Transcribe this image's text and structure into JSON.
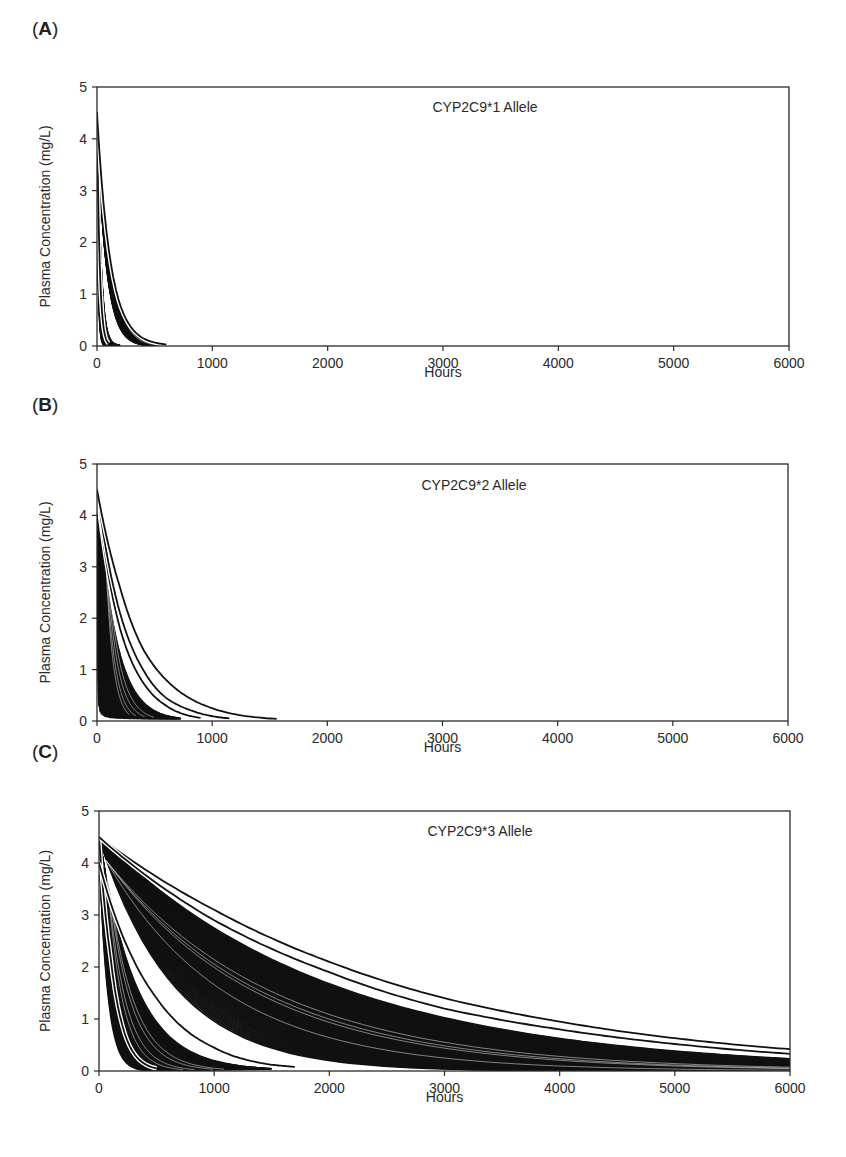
{
  "figure": {
    "panels": [
      {
        "id": "A",
        "label_open": "(",
        "label_letter": "A",
        "label_close": ")"
      },
      {
        "id": "B",
        "label_open": "(",
        "label_letter": "B",
        "label_close": ")"
      },
      {
        "id": "C",
        "label_open": "(",
        "label_letter": "C",
        "label_close": ")"
      }
    ]
  },
  "chart_data": [
    {
      "type": "line",
      "panel": "A",
      "title": "CYP2C9*1 Allele",
      "xlabel": "Hours",
      "ylabel": "Plasma Concentration (mg/L)",
      "xlim": [
        0,
        6000
      ],
      "ylim": [
        0,
        5
      ],
      "xticks": [
        0,
        1000,
        2000,
        3000,
        4000,
        5000,
        6000
      ],
      "yticks": [
        0,
        1,
        2,
        3,
        4,
        5
      ],
      "grid": false,
      "legend": null,
      "initial_concentration": 4.5,
      "description": "Many simulated exponential decay curves forming dense black bands; all reach ~0 by ~600 h",
      "bands": [
        {
          "name": "fast band",
          "t_end_range": [
            60,
            200
          ],
          "half_life_range": [
            8,
            22
          ]
        },
        {
          "name": "slow band",
          "t_end_range": [
            450,
            600
          ],
          "half_life_range": [
            55,
            80
          ]
        }
      ],
      "series": [
        {
          "name": "fastest curve",
          "x": [
            0,
            25,
            50,
            100
          ],
          "values": [
            4.5,
            1.5,
            0.5,
            0.05
          ]
        },
        {
          "name": "slowest curve",
          "x": [
            0,
            100,
            200,
            300,
            400,
            600
          ],
          "values": [
            4.5,
            1.9,
            0.8,
            0.35,
            0.15,
            0.03
          ]
        }
      ]
    },
    {
      "type": "line",
      "panel": "B",
      "title": "CYP2C9*2 Allele",
      "xlabel": "Hours",
      "ylabel": "Plasma Concentration (mg/L)",
      "xlim": [
        0,
        6000
      ],
      "ylim": [
        0,
        5
      ],
      "xticks": [
        0,
        1000,
        2000,
        3000,
        4000,
        5000,
        6000
      ],
      "yticks": [
        0,
        1,
        2,
        3,
        4,
        5
      ],
      "grid": false,
      "legend": null,
      "initial_concentration": 4.5,
      "description": "Dense band of decay curves ending before ~730 h plus three separate slower curves ending ~900, ~1150 and ~1560 h",
      "bands": [
        {
          "name": "main band",
          "t_end_range": [
            20,
            730
          ],
          "half_life_range": [
            5,
            110
          ]
        }
      ],
      "series": [
        {
          "name": "outlier 1",
          "x": [
            0,
            200,
            400,
            600,
            900
          ],
          "values": [
            4.5,
            1.8,
            0.75,
            0.3,
            0.06
          ]
        },
        {
          "name": "outlier 2",
          "x": [
            0,
            200,
            400,
            600,
            800,
            1150
          ],
          "values": [
            4.5,
            2.1,
            1.0,
            0.45,
            0.22,
            0.05
          ]
        },
        {
          "name": "outlier 3",
          "x": [
            0,
            200,
            400,
            600,
            800,
            1000,
            1560
          ],
          "values": [
            4.5,
            2.6,
            1.4,
            0.8,
            0.45,
            0.25,
            0.04
          ]
        }
      ]
    },
    {
      "type": "line",
      "panel": "C",
      "title": "CYP2C9*3 Allele",
      "xlabel": "Hours",
      "ylabel": "Plasma Concentration (mg/L)",
      "xlim": [
        0,
        6000
      ],
      "ylim": [
        0,
        5
      ],
      "xticks": [
        0,
        1000,
        2000,
        3000,
        4000,
        5000,
        6000
      ],
      "yticks": [
        0,
        1,
        2,
        3,
        4,
        5
      ],
      "grid": false,
      "legend": null,
      "initial_concentration": 4.5,
      "description": "Three clusters: fast curves ending ~500 h, a middle band ending ~1700 h, and a broad slow band extending past 6000 h; two slowest curves end at ~0.42 and ~0.33 mg/L at 6000 h",
      "bands": [
        {
          "name": "fast band",
          "t_end_range": [
            480,
            1500
          ],
          "half_life_range": [
            50,
            220
          ]
        },
        {
          "name": "slow band",
          "t_end_range": [
            6000,
            6000
          ],
          "half_life_range": [
            450,
            1400
          ]
        }
      ],
      "series": [
        {
          "name": "fastest curve",
          "x": [
            0,
            100,
            200,
            300,
            500
          ],
          "values": [
            4.5,
            2.2,
            0.9,
            0.35,
            0.05
          ]
        },
        {
          "name": "middle curve",
          "x": [
            0,
            500,
            1000,
            1500,
            1700
          ],
          "values": [
            4.0,
            1.4,
            0.45,
            0.12,
            0.08
          ]
        },
        {
          "name": "slowest curve 1",
          "x": [
            0,
            1000,
            2000,
            3000,
            4000,
            5000,
            6000
          ],
          "values": [
            4.5,
            3.1,
            2.1,
            1.4,
            0.95,
            0.63,
            0.42
          ]
        },
        {
          "name": "slowest curve 2",
          "x": [
            0,
            1000,
            2000,
            3000,
            4000,
            5000,
            6000
          ],
          "values": [
            4.5,
            2.9,
            1.9,
            1.2,
            0.8,
            0.52,
            0.33
          ]
        }
      ]
    }
  ],
  "layout": {
    "panels": [
      {
        "x0": 97,
        "x1": 789,
        "ytop": 87,
        "ybot": 346,
        "label_y": 20,
        "title_x": 485,
        "title_y": 112,
        "hours_y": 375
      },
      {
        "x0": 97,
        "x1": 788,
        "ytop": 464,
        "ybot": 721,
        "label_y": 396,
        "title_x": 474,
        "title_y": 490,
        "hours_y": 750
      },
      {
        "x0": 99,
        "x1": 790,
        "ytop": 811,
        "ybot": 1071,
        "label_y": 744,
        "title_x": 480,
        "title_y": 836,
        "hours_y": 1100
      }
    ]
  },
  "colors": {
    "ink": "#111111",
    "axis": "#2a2a2a",
    "background": "#ffffff"
  }
}
